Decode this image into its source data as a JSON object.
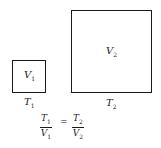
{
  "small_box": {
    "volume_var": "V",
    "volume_sub": "1",
    "temp_var": "T",
    "temp_sub": "1"
  },
  "large_box": {
    "volume_var": "V",
    "volume_sub": "2",
    "temp_var": "T",
    "temp_sub": "2"
  },
  "equation": {
    "left_num_var": "T",
    "left_num_sub": "1",
    "left_den_var": "V",
    "left_den_sub": "1",
    "equals": "=",
    "right_num_var": "T",
    "right_num_sub": "2",
    "right_den_var": "V",
    "right_den_sub": "2"
  }
}
